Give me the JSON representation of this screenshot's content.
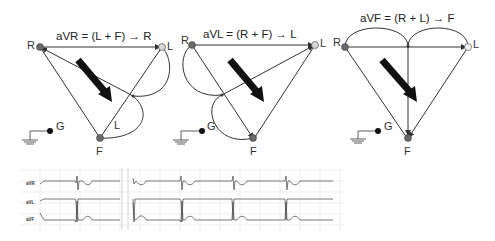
{
  "panels": [
    {
      "id": "avr",
      "title": "aVR = (L + F) → R",
      "nodes": {
        "R": "R",
        "L": "L",
        "F": "F",
        "G": "G"
      },
      "wire_label": "L"
    },
    {
      "id": "avl",
      "title": "aVL = (R + F) → L",
      "nodes": {
        "R": "R",
        "L": "L",
        "F": "F",
        "G": "G"
      }
    },
    {
      "id": "avf",
      "title": "aVF = (R + L) → F",
      "nodes": {
        "R": "R",
        "L": "L",
        "F": "F",
        "G": "G"
      }
    }
  ],
  "ecg": {
    "leads": [
      "aVR",
      "aVL",
      "aVF"
    ]
  },
  "colors": {
    "line": "#333333",
    "node_dark": "#6a6a6a",
    "node_light": "#d8d8d8",
    "arrow": "#111111",
    "grid": "#e2e2e2",
    "trace": "#555555"
  }
}
